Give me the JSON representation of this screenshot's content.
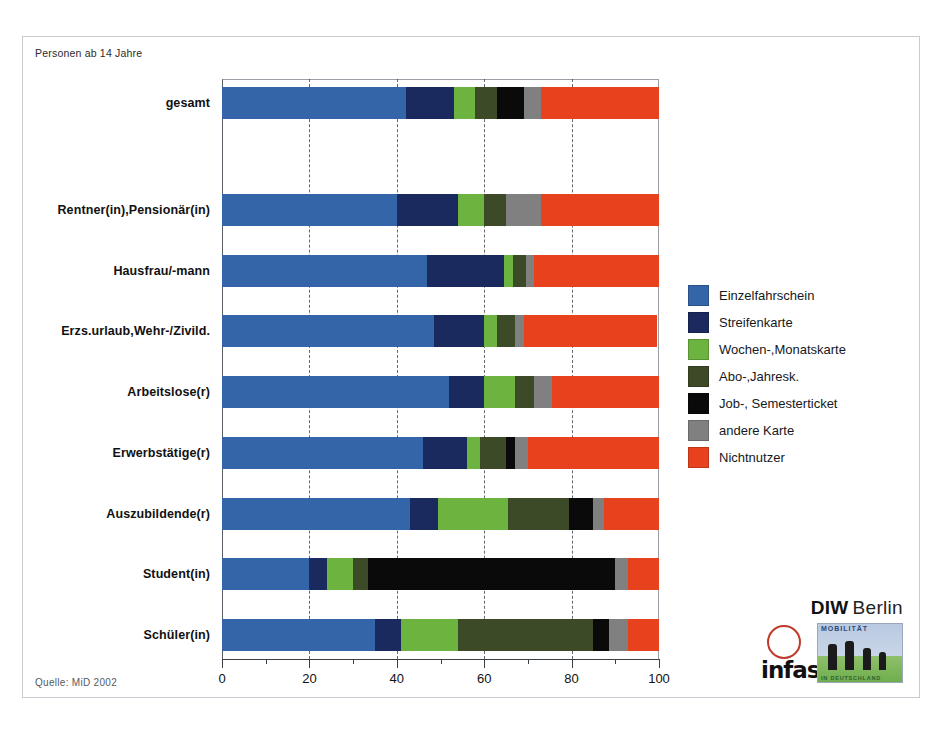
{
  "subtitle": "Personen ab 14 Jahre",
  "source_note": "Quelle: MiD 2002",
  "logos": {
    "diw_bold": "DIW",
    "diw_berlin": "Berlin",
    "infas": "infas",
    "mid_top": "MOBILITÄT",
    "mid_bottom": "IN DEUTSCHLAND"
  },
  "chart_data": {
    "type": "bar",
    "orientation": "horizontal",
    "stacked": true,
    "title": "",
    "subtitle": "Personen ab 14 Jahre",
    "xlabel": "",
    "ylabel": "",
    "xlim": [
      0,
      100
    ],
    "xticks": [
      0,
      20,
      40,
      60,
      80,
      100
    ],
    "xtick_labels": [
      "0",
      "20",
      "40",
      "60",
      "80",
      "100"
    ],
    "minor_xticks": [
      10,
      30,
      50,
      70,
      90
    ],
    "grid": "vertical-dashed-at-major",
    "legend_position": "right",
    "units": "Prozent",
    "colors": {
      "Einzelfahrschein": "#3465a8",
      "Streifenkarte": "#1b2a5e",
      "Wochen-,Monatskarte": "#6db33f",
      "Abo-,Jahresk.": "#3c4a28",
      "Job-, Semesterticket": "#0a0a0a",
      "andere Karte": "#808080",
      "Nichtnutzer": "#e8411e"
    },
    "legend": [
      {
        "label": "Einzelfahrschein",
        "color": "#3465a8"
      },
      {
        "label": "Streifenkarte",
        "color": "#1b2a5e"
      },
      {
        "label": "Wochen-,Monatskarte",
        "color": "#6db33f"
      },
      {
        "label": "Abo-,Jahresk.",
        "color": "#3c4a28"
      },
      {
        "label": "Job-, Semesterticket",
        "color": "#0a0a0a"
      },
      {
        "label": "andere Karte",
        "color": "#808080"
      },
      {
        "label": "Nichtnutzer",
        "color": "#e8411e"
      }
    ],
    "categories": [
      "gesamt",
      "Rentner(in),Pensionär(in)",
      "Hausfrau/-mann",
      "Erzs.urlaub,Wehr-/Zivild.",
      "Arbeitslose(r)",
      "Erwerbstätige(r)",
      "Auszubildende(r)",
      "Student(in)",
      "Schüler(in)"
    ],
    "series": [
      {
        "name": "Einzelfahrschein",
        "values": [
          42.0,
          40.0,
          47.0,
          48.5,
          52.0,
          46.0,
          43.0,
          20.0,
          35.0
        ]
      },
      {
        "name": "Streifenkarte",
        "values": [
          11.0,
          14.0,
          17.5,
          11.5,
          8.0,
          10.0,
          6.5,
          4.0,
          6.0
        ]
      },
      {
        "name": "Wochen-,Monatskarte",
        "values": [
          5.0,
          6.0,
          2.0,
          3.0,
          7.0,
          3.0,
          16.0,
          6.0,
          13.0
        ]
      },
      {
        "name": "Abo-,Jahresk.",
        "values": [
          5.0,
          5.0,
          3.0,
          4.0,
          4.5,
          6.0,
          14.0,
          3.5,
          31.0
        ]
      },
      {
        "name": "Job-, Semesterticket",
        "values": [
          6.0,
          0.0,
          0.0,
          0.0,
          0.0,
          2.0,
          5.5,
          56.5,
          3.5
        ]
      },
      {
        "name": "andere Karte",
        "values": [
          4.0,
          8.0,
          2.0,
          2.0,
          4.0,
          3.0,
          2.5,
          3.0,
          4.5
        ]
      },
      {
        "name": "Nichtnutzer",
        "values": [
          27.0,
          27.0,
          28.5,
          30.5,
          24.5,
          30.0,
          12.5,
          7.0,
          7.0
        ]
      }
    ],
    "rows": [
      {
        "category": "gesamt",
        "values": [
          42.0,
          11.0,
          5.0,
          5.0,
          6.0,
          4.0,
          27.0
        ]
      },
      {
        "category": "Rentner(in),Pensionär(in)",
        "values": [
          40.0,
          14.0,
          6.0,
          5.0,
          0.0,
          8.0,
          27.0
        ]
      },
      {
        "category": "Hausfrau/-mann",
        "values": [
          47.0,
          17.5,
          2.0,
          3.0,
          0.0,
          2.0,
          28.5
        ]
      },
      {
        "category": "Erzs.urlaub,Wehr-/Zivild.",
        "values": [
          48.5,
          11.5,
          3.0,
          4.0,
          0.0,
          2.0,
          30.5
        ]
      },
      {
        "category": "Arbeitslose(r)",
        "values": [
          52.0,
          8.0,
          7.0,
          4.5,
          0.0,
          4.0,
          24.5
        ]
      },
      {
        "category": "Erwerbstätige(r)",
        "values": [
          46.0,
          10.0,
          3.0,
          6.0,
          2.0,
          3.0,
          30.0
        ]
      },
      {
        "category": "Auszubildende(r)",
        "values": [
          43.0,
          6.5,
          16.0,
          14.0,
          5.5,
          2.5,
          12.5
        ]
      },
      {
        "category": "Student(in)",
        "values": [
          20.0,
          4.0,
          6.0,
          3.5,
          56.5,
          3.0,
          7.0
        ]
      },
      {
        "category": "Schüler(in)",
        "values": [
          35.0,
          6.0,
          13.0,
          31.0,
          3.5,
          4.5,
          7.0
        ]
      }
    ]
  }
}
